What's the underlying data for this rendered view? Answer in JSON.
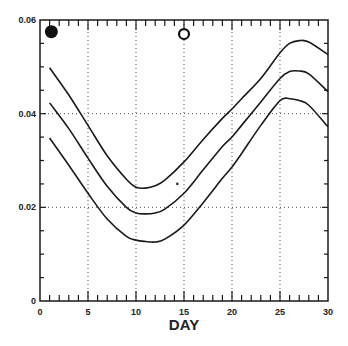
{
  "chart_data": {
    "type": "line",
    "title": "",
    "xlabel": "DAY",
    "ylabel": "",
    "xlim": [
      0,
      30
    ],
    "ylim": [
      0,
      0.06
    ],
    "grid": "dotted",
    "x_ticks": [
      0,
      5,
      10,
      15,
      20,
      25,
      30
    ],
    "x_tick_labels": [
      "0",
      "5",
      "10",
      "15",
      "20",
      "25",
      "30"
    ],
    "y_ticks": [
      0,
      0.02,
      0.04,
      0.06
    ],
    "y_tick_labels": [
      "0",
      "0.02",
      "0.04",
      "0.06"
    ],
    "x": [
      1,
      3,
      5,
      7,
      9,
      10,
      11,
      12,
      13,
      15,
      17,
      19,
      20,
      21,
      23,
      25,
      26,
      27,
      28,
      30
    ],
    "series": [
      {
        "name": "upper",
        "values": [
          0.0498,
          0.044,
          0.0375,
          0.031,
          0.026,
          0.0243,
          0.0241,
          0.0246,
          0.0258,
          0.0297,
          0.0345,
          0.039,
          0.041,
          0.0432,
          0.0475,
          0.053,
          0.055,
          0.0556,
          0.0553,
          0.0526
        ]
      },
      {
        "name": "middle",
        "values": [
          0.0423,
          0.0368,
          0.0305,
          0.0245,
          0.02,
          0.0188,
          0.0186,
          0.0188,
          0.0196,
          0.023,
          0.028,
          0.033,
          0.035,
          0.0375,
          0.0425,
          0.0475,
          0.049,
          0.0491,
          0.0485,
          0.0447
        ]
      },
      {
        "name": "lower",
        "values": [
          0.0348,
          0.029,
          0.023,
          0.0175,
          0.0138,
          0.013,
          0.0127,
          0.0126,
          0.0132,
          0.0162,
          0.021,
          0.0262,
          0.0286,
          0.0315,
          0.0375,
          0.0428,
          0.0432,
          0.0428,
          0.0418,
          0.0372
        ]
      }
    ],
    "markers": [
      {
        "type": "filled-circle",
        "x": 0.35,
        "y": 0.0575
      },
      {
        "type": "open-circle",
        "x": 15,
        "y": 0.057
      },
      {
        "type": "dot",
        "x": 14.3,
        "y": 0.025
      }
    ],
    "legend": null
  },
  "colors": {
    "line": "#1a1a1a",
    "grid": "#555555",
    "background": "#ffffff"
  }
}
